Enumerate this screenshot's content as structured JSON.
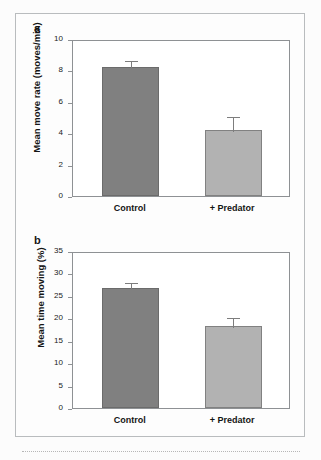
{
  "figure": {
    "panels": [
      {
        "letter": "a",
        "ylabel": "Mean move rate (moves/min)",
        "yticks": [
          "0",
          "2",
          "4",
          "6",
          "8",
          "10"
        ],
        "xlabels": [
          "Control",
          "+ Predator"
        ]
      },
      {
        "letter": "b",
        "ylabel": "Mean time moving (%)",
        "yticks": [
          "0",
          "5",
          "10",
          "15",
          "20",
          "25",
          "30",
          "35"
        ],
        "xlabels": [
          "Control",
          "+ Predator"
        ]
      }
    ]
  },
  "colors": {
    "bar_control": "#808080",
    "bar_predator": "#b2b2b2",
    "axis": "#8e9194",
    "frame": "#b9bcbe",
    "text": "#151515",
    "error_bar": "#7d7d7d"
  },
  "chart_data": [
    {
      "type": "bar",
      "panel": "a",
      "title": "",
      "xlabel": "",
      "ylabel": "Mean move rate (moves/min)",
      "categories": [
        "Control",
        "+ Predator"
      ],
      "values": [
        8.2,
        4.2
      ],
      "errors": [
        0.55,
        0.95
      ],
      "ylim": [
        0,
        10
      ],
      "ytick_values": [
        0,
        2,
        4,
        6,
        8,
        10
      ],
      "grid": false,
      "legend": "none",
      "bar_colors": [
        "#808080",
        "#b2b2b2"
      ]
    },
    {
      "type": "bar",
      "panel": "b",
      "title": "",
      "xlabel": "",
      "ylabel": "Mean time moving (%)",
      "categories": [
        "Control",
        "+ Predator"
      ],
      "values": [
        26.8,
        18.3
      ],
      "errors": [
        1.6,
        2.2
      ],
      "ylim": [
        0,
        35
      ],
      "ytick_values": [
        0,
        5,
        10,
        15,
        20,
        25,
        30,
        35
      ],
      "grid": false,
      "legend": "none",
      "bar_colors": [
        "#808080",
        "#b2b2b2"
      ]
    }
  ]
}
